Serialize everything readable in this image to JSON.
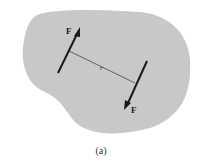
{
  "figure": {
    "caption": "(a)",
    "body_color": "#c8c8c8",
    "ink_color": "#1a1a1a",
    "line_color": "#555555",
    "forces": [
      {
        "label": "F",
        "direction": "up-right"
      },
      {
        "label": "F",
        "direction": "down-left"
      }
    ],
    "distance_label": "r"
  }
}
